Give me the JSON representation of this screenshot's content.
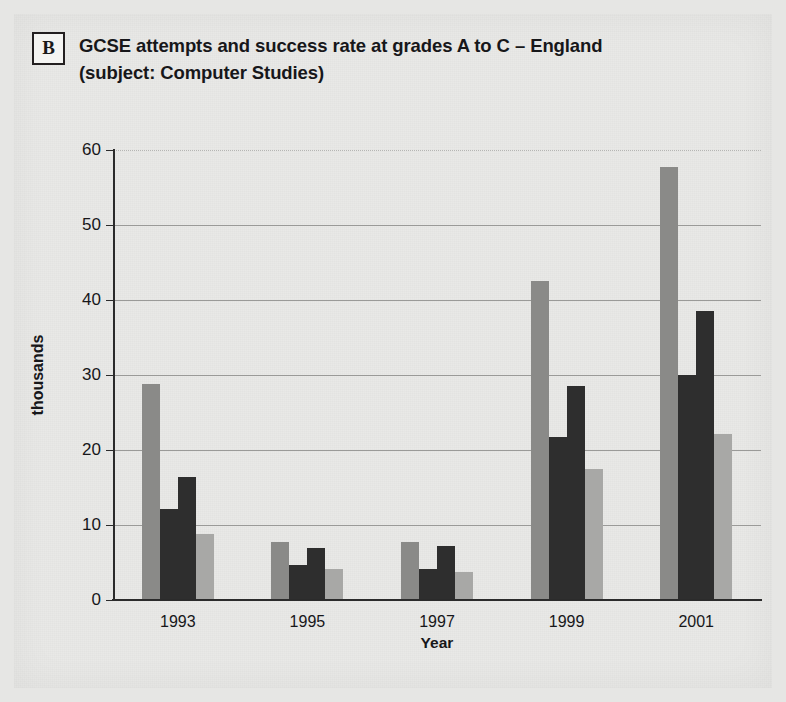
{
  "panel": {
    "badge": "B"
  },
  "header": {
    "title_line_1": "GCSE attempts and success rate at grades A to C – England",
    "title_line_2": "(subject: Computer Studies)"
  },
  "colors": {
    "series_1": "#8a8a88",
    "series_2": "#2e2e2e",
    "series_3": "#2e2e2e",
    "series_4": "#a8a8a6",
    "axis": "#2b2b2b",
    "gridline": "#9a9a98",
    "background": "#e9e9e7",
    "text": "#17171a"
  },
  "chart_data": {
    "type": "bar",
    "title": "GCSE attempts and success rate at grades A to C – England (subject: Computer Studies)",
    "xlabel": "Year",
    "ylabel": "thousands",
    "ylim": [
      0,
      60
    ],
    "yticks": [
      0,
      10,
      20,
      30,
      40,
      50,
      60
    ],
    "ytick_labels": [
      "0",
      "10",
      "20",
      "30",
      "40",
      "50",
      "60"
    ],
    "grid": true,
    "legend": "none",
    "categories": [
      "1993",
      "1995",
      "1997",
      "1999",
      "2001"
    ],
    "series": [
      {
        "name": "bar-1",
        "color": "#8a8a88",
        "values": [
          28.8,
          7.7,
          7.7,
          42.5,
          57.8
        ]
      },
      {
        "name": "bar-2",
        "color": "#2e2e2e",
        "values": [
          12.2,
          4.7,
          4.2,
          21.8,
          30.0
        ]
      },
      {
        "name": "bar-3",
        "color": "#2e2e2e",
        "values": [
          16.4,
          7.0,
          7.2,
          28.5,
          38.5
        ]
      },
      {
        "name": "bar-4",
        "color": "#a8a8a6",
        "values": [
          8.8,
          4.2,
          3.7,
          17.5,
          22.2
        ]
      }
    ]
  }
}
